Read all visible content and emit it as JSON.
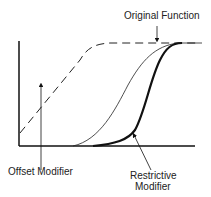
{
  "diagram": {
    "labels": {
      "original": "Original Function",
      "offset": "Offset Modifier",
      "restrictive_line1": "Restrictive",
      "restrictive_line2": "Modifier"
    },
    "colors": {
      "line": "#111111",
      "background": "#ffffff"
    }
  }
}
